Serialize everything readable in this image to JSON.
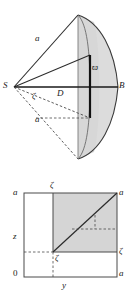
{
  "figure": {
    "stroke_color": "#1a1a1a",
    "shade_color": "#d3d3d3",
    "shade_color_light": "#dcdcdc",
    "background": "#ffffff"
  },
  "top_diagram": {
    "name": "cone-spherical-cap-cross-section",
    "labels": {
      "apex_side_a": "a",
      "lower_side_a": "a",
      "vertex_s": "S",
      "point_d": "D",
      "point_b": "B",
      "angle_zeta": "ζ",
      "segment_varpi": "ϖ"
    },
    "label_positions": {
      "apex_side_a": {
        "x": 35,
        "y": 40
      },
      "lower_side_a": {
        "x": 35,
        "y": 121
      },
      "vertex_s": {
        "x": 4,
        "y": 82
      },
      "point_d": {
        "x": 58,
        "y": 90
      },
      "point_b": {
        "x": 119,
        "y": 82
      },
      "angle_zeta": {
        "x": 32,
        "y": 95
      },
      "segment_varpi": {
        "x": 89,
        "y": 64
      }
    },
    "geometry": {
      "vertex_s": {
        "x": 14,
        "y": 87
      },
      "point_b": {
        "x": 118,
        "y": 87
      },
      "point_d": {
        "x": 62,
        "y": 87
      },
      "apex": {
        "x": 78,
        "y": 15
      },
      "chord_x": 78,
      "arc_x": 94,
      "cap_right_edge": 118
    }
  },
  "bottom_diagram": {
    "name": "square-domain-integration-region",
    "labels": {
      "axis_top_left_a": "a",
      "axis_top_zeta": "ζ",
      "axis_top_right_a": "a",
      "axis_left_z": "z",
      "axis_inner_zeta": "ζ",
      "axis_right_zeta": "ζ",
      "origin": "0",
      "axis_bottom_y": "y",
      "axis_bottom_right_a": "a"
    },
    "label_positions": {
      "axis_top_left_a": {
        "x": 13,
        "y": 189
      },
      "axis_top_zeta": {
        "x": 49,
        "y": 185
      },
      "axis_top_right_a": {
        "x": 119,
        "y": 189
      },
      "axis_left_z": {
        "x": 13,
        "y": 236
      },
      "axis_inner_zeta": {
        "x": 55,
        "y": 258
      },
      "axis_right_zeta": {
        "x": 119,
        "y": 249
      },
      "origin": {
        "x": 13,
        "y": 271
      },
      "axis_bottom_y": {
        "x": 60,
        "y": 283
      },
      "axis_bottom_right_a": {
        "x": 119,
        "y": 271
      }
    },
    "geometry": {
      "square_left": 24,
      "square_right": 117,
      "square_top": 193,
      "square_bottom": 277,
      "zeta_x": 53,
      "zeta_y": 252,
      "dash_inner_x": 95,
      "dash_inner_y": 229
    }
  }
}
